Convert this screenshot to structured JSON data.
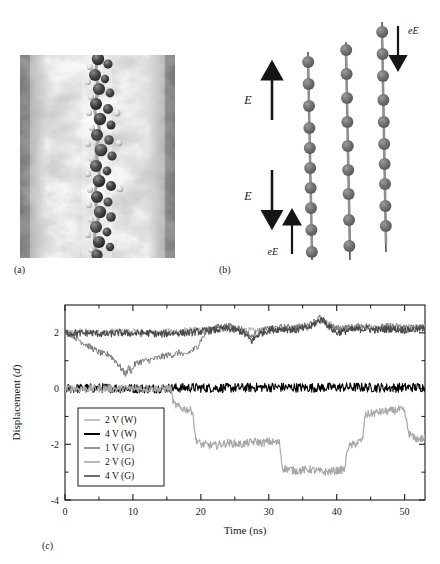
{
  "figure": {
    "panels": [
      {
        "id": "a",
        "label": "(a)",
        "kind": "molecular-rendering",
        "description": "grayscale molecular dynamics snapshot of a molecular chain inside a channel"
      },
      {
        "id": "b",
        "label": "(b)",
        "kind": "schematic"
      },
      {
        "id": "c",
        "label": "(c)",
        "kind": "line-chart"
      }
    ]
  },
  "panel_b": {
    "field_label_upper": "E",
    "field_label_lower": "E",
    "force_label_lower_left": "eE",
    "force_label_upper_right": "eE",
    "chains": 3,
    "beads_per_chain": [
      10,
      9,
      10
    ],
    "bead_color": "#6e6e6e",
    "arrow_color": "#151515"
  },
  "chart_data": {
    "type": "line",
    "title": "",
    "xlabel": "Time (ns)",
    "ylabel": "Displacement (d)",
    "ylabel_italic_part": "d",
    "xlim": [
      0,
      53
    ],
    "ylim": [
      -4,
      3
    ],
    "xticks": [
      0,
      10,
      20,
      30,
      40,
      50
    ],
    "xticklabels": [
      "0",
      "10",
      "20",
      "30",
      "40",
      "50"
    ],
    "xminorticks": [
      5,
      15,
      25,
      35,
      45
    ],
    "yticks": [
      2,
      0,
      -2,
      -4
    ],
    "yticklabels": [
      "2",
      "0",
      "-2",
      "-4"
    ],
    "yminorticks": [
      1,
      -1,
      -3
    ],
    "grid": false,
    "legend_position": "lower-left-inside",
    "series": [
      {
        "name": "2 V (W)",
        "color": "#b3b3b3",
        "width": 1.0,
        "noise": 0.13,
        "points": [
          [
            0,
            2.0
          ],
          [
            2,
            2.05
          ],
          [
            5,
            2.0
          ],
          [
            8,
            2.05
          ],
          [
            12,
            2.0
          ],
          [
            16,
            2.05
          ],
          [
            20,
            2.1
          ],
          [
            24,
            2.15
          ],
          [
            28,
            2.05
          ],
          [
            32,
            2.15
          ],
          [
            36,
            2.2
          ],
          [
            38,
            2.45
          ],
          [
            40,
            2.15
          ],
          [
            44,
            2.2
          ],
          [
            48,
            2.15
          ],
          [
            53,
            2.2
          ]
        ]
      },
      {
        "name": "4 V (W)",
        "color": "#000000",
        "width": 1.1,
        "noise": 0.17,
        "points": [
          [
            0,
            0.0
          ],
          [
            6,
            0.02
          ],
          [
            12,
            0.0
          ],
          [
            18,
            0.03
          ],
          [
            24,
            0.02
          ],
          [
            30,
            0.05
          ],
          [
            36,
            0.03
          ],
          [
            42,
            0.05
          ],
          [
            48,
            0.03
          ],
          [
            53,
            0.05
          ]
        ]
      },
      {
        "name": "1 V (G)",
        "color": "#7a7a7a",
        "width": 1.0,
        "noise": 0.12,
        "points": [
          [
            0,
            2.0
          ],
          [
            1,
            1.95
          ],
          [
            2,
            1.75
          ],
          [
            3,
            1.6
          ],
          [
            4,
            1.45
          ],
          [
            5,
            1.3
          ],
          [
            6,
            1.2
          ],
          [
            6.5,
            1.25
          ],
          [
            7,
            1.1
          ],
          [
            7.6,
            0.95
          ],
          [
            8,
            0.82
          ],
          [
            8.6,
            0.6
          ],
          [
            9,
            0.52
          ],
          [
            9.4,
            0.78
          ],
          [
            9.8,
            0.6
          ],
          [
            10.2,
            0.85
          ],
          [
            10.8,
            0.95
          ],
          [
            11.4,
            0.98
          ],
          [
            12,
            1.0
          ],
          [
            13,
            1.05
          ],
          [
            14,
            1.12
          ],
          [
            15,
            1.2
          ],
          [
            16,
            1.22
          ],
          [
            17,
            1.3
          ],
          [
            17.6,
            1.15
          ],
          [
            18.2,
            1.3
          ],
          [
            19,
            1.4
          ],
          [
            19.6,
            1.55
          ],
          [
            20,
            1.75
          ],
          [
            20.6,
            1.95
          ],
          [
            21,
            2.1
          ],
          [
            22,
            2.2
          ],
          [
            24,
            2.25
          ],
          [
            26,
            2.15
          ],
          [
            27.5,
            1.85
          ],
          [
            28.5,
            2.05
          ],
          [
            30,
            2.15
          ],
          [
            32,
            2.2
          ],
          [
            34,
            2.2
          ],
          [
            36,
            2.3
          ],
          [
            37.5,
            2.55
          ],
          [
            38.5,
            2.3
          ],
          [
            40,
            2.15
          ],
          [
            42,
            2.2
          ],
          [
            44,
            2.25
          ],
          [
            46,
            2.2
          ],
          [
            48,
            2.25
          ],
          [
            50,
            2.2
          ],
          [
            53,
            2.2
          ]
        ]
      },
      {
        "name": "2 V (G)",
        "color": "#a8a8a8",
        "width": 1.2,
        "noise": 0.14,
        "points": [
          [
            0,
            0.0
          ],
          [
            8,
            0.0
          ],
          [
            14,
            0.0
          ],
          [
            15.6,
            0.0
          ],
          [
            16,
            -0.55
          ],
          [
            17,
            -0.7
          ],
          [
            18,
            -0.75
          ],
          [
            18.8,
            -0.8
          ],
          [
            19.2,
            -1.8
          ],
          [
            20,
            -2.0
          ],
          [
            22,
            -2.05
          ],
          [
            24,
            -1.95
          ],
          [
            26,
            -2.0
          ],
          [
            28,
            -1.9
          ],
          [
            29,
            -1.95
          ],
          [
            30,
            -1.9
          ],
          [
            31.6,
            -1.95
          ],
          [
            32,
            -2.85
          ],
          [
            34,
            -2.95
          ],
          [
            36,
            -2.9
          ],
          [
            38,
            -3.0
          ],
          [
            40,
            -2.95
          ],
          [
            41.2,
            -2.9
          ],
          [
            41.6,
            -2.1
          ],
          [
            43,
            -1.95
          ],
          [
            43.8,
            -1.85
          ],
          [
            44.2,
            -0.95
          ],
          [
            46,
            -0.85
          ],
          [
            48,
            -0.8
          ],
          [
            49.4,
            -0.75
          ],
          [
            50,
            -0.85
          ],
          [
            50.6,
            -1.6
          ],
          [
            51.5,
            -1.8
          ],
          [
            53,
            -1.8
          ]
        ]
      },
      {
        "name": "4 V (G)",
        "color": "#4a4a4a",
        "width": 1.1,
        "noise": 0.13,
        "points": [
          [
            0,
            2.0
          ],
          [
            2,
            1.98
          ],
          [
            4,
            2.0
          ],
          [
            6,
            1.95
          ],
          [
            8,
            2.0
          ],
          [
            10,
            1.98
          ],
          [
            12,
            2.0
          ],
          [
            14,
            1.95
          ],
          [
            16,
            2.0
          ],
          [
            18,
            2.0
          ],
          [
            20,
            2.05
          ],
          [
            22,
            2.1
          ],
          [
            24,
            2.15
          ],
          [
            26,
            2.05
          ],
          [
            27.5,
            1.7
          ],
          [
            28.5,
            1.95
          ],
          [
            30,
            2.1
          ],
          [
            32,
            2.15
          ],
          [
            34,
            2.1
          ],
          [
            36,
            2.2
          ],
          [
            37.8,
            2.5
          ],
          [
            39,
            2.2
          ],
          [
            40,
            2.0
          ],
          [
            42,
            2.1
          ],
          [
            44,
            2.15
          ],
          [
            46,
            2.1
          ],
          [
            48,
            2.15
          ],
          [
            50,
            2.1
          ],
          [
            53,
            2.15
          ]
        ]
      }
    ],
    "legend_entries": [
      {
        "label": "2 V (W)",
        "color": "#b3b3b3"
      },
      {
        "label": "4 V (W)",
        "color": "#000000"
      },
      {
        "label": "1 V (G)",
        "color": "#7a7a7a"
      },
      {
        "label": "2 V (G)",
        "color": "#a8a8a8"
      },
      {
        "label": "4 V (G)",
        "color": "#4a4a4a"
      }
    ]
  }
}
